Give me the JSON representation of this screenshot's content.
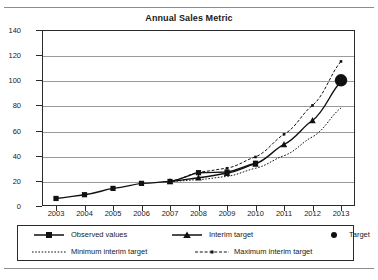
{
  "chart_data": {
    "type": "line",
    "title": "Annual Sales Metric",
    "xlabel": "",
    "ylabel": "",
    "grid": true,
    "legend_position": "bottom",
    "x": [
      2003,
      2004,
      2005,
      2006,
      2007,
      2008,
      2009,
      2010,
      2011,
      2012,
      2013
    ],
    "xticklabels": [
      "2003",
      "2004",
      "2005",
      "2006",
      "2007",
      "2008",
      "2009",
      "2010",
      "2011",
      "2012",
      "2013"
    ],
    "ylim": [
      0,
      140
    ],
    "yticks": [
      0,
      20,
      40,
      60,
      80,
      100,
      120,
      140
    ],
    "yticklabels": [
      "0",
      "20",
      "40",
      "60",
      "80",
      "100",
      "120",
      "140"
    ],
    "series": [
      {
        "name": "Observed values",
        "style": "solid",
        "marker": "square",
        "x": [
          2003,
          2004,
          2005,
          2006,
          2007,
          2008,
          2009,
          2010
        ],
        "values": [
          6,
          9,
          14,
          18,
          19.5,
          26.5,
          27,
          34
        ]
      },
      {
        "name": "Interim target",
        "style": "solid",
        "marker": "triangle",
        "x": [
          2007,
          2008,
          2009,
          2010,
          2011,
          2012,
          2013
        ],
        "values": [
          19.5,
          22.5,
          26,
          33.5,
          49,
          68,
          99
        ]
      },
      {
        "name": "Minimum interim target",
        "style": "dotted",
        "marker": "none",
        "x": [
          2007,
          2008,
          2009,
          2010,
          2011,
          2012,
          2013
        ],
        "values": [
          19.5,
          21,
          23.5,
          30,
          40,
          55,
          78
        ]
      },
      {
        "name": "Maximum interim target",
        "style": "dashed",
        "marker": "small-dot",
        "x": [
          2007,
          2008,
          2009,
          2010,
          2011,
          2012,
          2013
        ],
        "values": [
          19.5,
          27,
          30,
          39,
          57,
          80,
          115
        ]
      },
      {
        "name": "Target",
        "style": "none",
        "marker": "big-dot",
        "x": [
          2013
        ],
        "values": [
          100
        ]
      }
    ],
    "colors": {
      "line": "#111111",
      "grid": "#9a9a9a",
      "axis": "#2a2a2a",
      "background": "#ffffff"
    }
  },
  "legend": {
    "rows": [
      [
        {
          "label": "Observed values",
          "key": "solid-square-key"
        },
        {
          "label": "Interim target",
          "key": "solid-triangle-key"
        },
        {
          "label": "Target",
          "key": "big-dot-key"
        }
      ],
      [
        {
          "label": "Minimum interim target",
          "key": "dotted-key"
        },
        {
          "label": "Maximum interim target",
          "key": "dashed-dot-key"
        }
      ]
    ]
  }
}
